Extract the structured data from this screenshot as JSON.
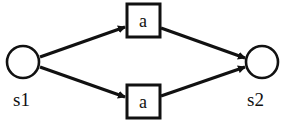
{
  "diagram": {
    "type": "petri-net",
    "places": [
      {
        "id": "s1",
        "label": "s1"
      },
      {
        "id": "s2",
        "label": "s2"
      }
    ],
    "transitions": [
      {
        "id": "t_top",
        "label": "a"
      },
      {
        "id": "t_bottom",
        "label": "a"
      }
    ],
    "arcs": [
      {
        "from": "s1",
        "to": "t_top"
      },
      {
        "from": "s1",
        "to": "t_bottom"
      },
      {
        "from": "t_top",
        "to": "s2"
      },
      {
        "from": "t_bottom",
        "to": "s2"
      }
    ],
    "colors": {
      "stroke": "#111111",
      "background": "#ffffff"
    }
  }
}
